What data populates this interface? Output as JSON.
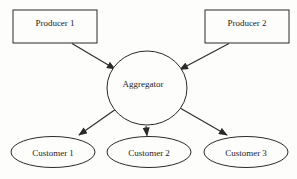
{
  "diagram": {
    "type": "flow-diagram",
    "background_color": "#fdfdfc",
    "stroke_color": "#2a2a2a",
    "text_color": "#1c1c1c",
    "nodes": {
      "producer1": {
        "label": "Producer 1",
        "shape": "rectangle"
      },
      "producer2": {
        "label": "Producer 2",
        "shape": "rectangle"
      },
      "aggregator": {
        "label": "Aggregator",
        "shape": "circle"
      },
      "customer1": {
        "label": "Customer 1",
        "shape": "ellipse"
      },
      "customer2": {
        "label": "Customer 2",
        "shape": "ellipse"
      },
      "customer3": {
        "label": "Customer 3",
        "shape": "ellipse"
      }
    },
    "edges": [
      {
        "from": "Producer 1",
        "to": "Aggregator",
        "arrow": "solid-triangle"
      },
      {
        "from": "Producer 2",
        "to": "Aggregator",
        "arrow": "solid-triangle"
      },
      {
        "from": "Aggregator",
        "to": "Customer 1",
        "arrow": "solid-triangle"
      },
      {
        "from": "Aggregator",
        "to": "Customer 2",
        "arrow": "solid-triangle"
      },
      {
        "from": "Aggregator",
        "to": "Customer 3",
        "arrow": "solid-triangle"
      }
    ]
  }
}
